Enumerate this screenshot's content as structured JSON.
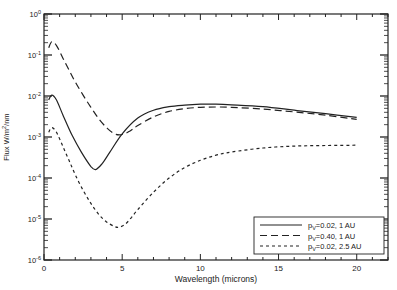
{
  "chart_data": {
    "type": "line",
    "title": "",
    "xlabel": "Wavelength (microns)",
    "ylabel": "Flux W/m²/nm",
    "xlim": [
      0,
      22
    ],
    "ylim": [
      1e-06,
      1
    ],
    "yscale": "log",
    "grid": false,
    "legend_position": "lower right",
    "x_ticks": [
      0,
      5,
      10,
      15,
      20
    ],
    "x_tick_labels": [
      "0",
      "5",
      "10",
      "15",
      "20"
    ],
    "y_ticks": [
      1e-06,
      1e-05,
      0.0001,
      0.001,
      0.01,
      0.1,
      1
    ],
    "y_tick_labels": [
      {
        "base": "10",
        "exp": "-6"
      },
      {
        "base": "10",
        "exp": "-5"
      },
      {
        "base": "10",
        "exp": "-4"
      },
      {
        "base": "10",
        "exp": "-3"
      },
      {
        "base": "10",
        "exp": "-2"
      },
      {
        "base": "10",
        "exp": "-1"
      },
      {
        "base": "10",
        "exp": "0"
      }
    ],
    "series": [
      {
        "name": "pV=0.02, 1 AU",
        "label_sub": "V",
        "label_rest": "=0.02, 1 AU",
        "style": "solid",
        "x": [
          0.3,
          0.5,
          0.8,
          1.2,
          1.8,
          2.4,
          3.0,
          3.3,
          3.7,
          4.2,
          5.0,
          6.0,
          7.0,
          8.0,
          9.0,
          10.0,
          11.0,
          12.0,
          14.0,
          16.0,
          18.0,
          20.0
        ],
        "y": [
          0.008,
          0.0105,
          0.008,
          0.0035,
          0.0011,
          0.00042,
          0.00019,
          0.00016,
          0.00022,
          0.00042,
          0.0012,
          0.0029,
          0.0045,
          0.0055,
          0.006,
          0.0063,
          0.0063,
          0.0061,
          0.0055,
          0.0045,
          0.0037,
          0.003
        ]
      },
      {
        "name": "pV=0.40, 1 AU",
        "label_sub": "V",
        "label_rest": "=0.40, 1 AU",
        "style": "long-dash",
        "x": [
          0.3,
          0.5,
          0.8,
          1.2,
          1.6,
          2.0,
          2.5,
          3.0,
          3.5,
          4.0,
          4.5,
          5.0,
          5.5,
          6.0,
          7.0,
          8.0,
          9.0,
          10.0,
          11.0,
          12.0,
          14.0,
          16.0,
          18.0,
          20.0
        ],
        "y": [
          0.15,
          0.21,
          0.17,
          0.085,
          0.043,
          0.022,
          0.0105,
          0.0053,
          0.0028,
          0.0017,
          0.0012,
          0.00115,
          0.0014,
          0.0019,
          0.0031,
          0.0042,
          0.0049,
          0.0053,
          0.0054,
          0.0053,
          0.0048,
          0.0041,
          0.0034,
          0.0027
        ]
      },
      {
        "name": "pV=0.02, 2.5 AU",
        "label_sub": "V",
        "label_rest": "=0.02, 2.5 AU",
        "style": "short-dash",
        "x": [
          0.3,
          0.5,
          0.8,
          1.2,
          1.6,
          2.0,
          2.5,
          3.0,
          3.5,
          4.0,
          4.5,
          4.8,
          5.2,
          5.6,
          6.0,
          7.0,
          8.0,
          9.0,
          10.0,
          11.0,
          12.0,
          14.0,
          16.0,
          18.0,
          20.0
        ],
        "y": [
          0.0013,
          0.0017,
          0.0013,
          0.0006,
          0.00027,
          0.00012,
          5e-05,
          2.4e-05,
          1.3e-05,
          8.5e-06,
          6.6e-06,
          6.3e-06,
          7.5e-06,
          1.1e-05,
          1.7e-05,
          4.5e-05,
          0.0001,
          0.00018,
          0.00027,
          0.00036,
          0.00043,
          0.00054,
          0.0006,
          0.00062,
          0.00063
        ]
      }
    ],
    "legend": [
      {
        "p": "p",
        "sub": "V",
        "rest": "=0.02, 1 AU"
      },
      {
        "p": "p",
        "sub": "V",
        "rest": "=0.40, 1 AU"
      },
      {
        "p": "p",
        "sub": "V",
        "rest": "=0.02, 2.5 AU"
      }
    ]
  }
}
